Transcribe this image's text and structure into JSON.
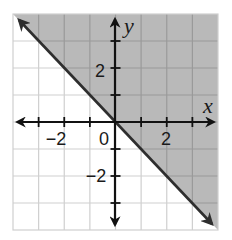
{
  "chart_data": {
    "type": "line",
    "title": "",
    "subtitle": "",
    "xlabel": "x",
    "ylabel": "y",
    "xlim": [
      -4,
      4
    ],
    "ylim": [
      -4,
      4
    ],
    "grid": true,
    "grid_step": 1,
    "legend": null,
    "x_tick_labels": [
      {
        "value": -2,
        "label": "−2"
      },
      {
        "value": 0,
        "label": "0"
      },
      {
        "value": 2,
        "label": "2"
      }
    ],
    "y_tick_labels": [
      {
        "value": 2,
        "label": "2"
      },
      {
        "value": -2,
        "label": "−2"
      }
    ],
    "x_ticks": [
      -3,
      -2,
      -1,
      0,
      1,
      2,
      3
    ],
    "y_ticks": [
      -3,
      -2,
      -1,
      1,
      2,
      3
    ],
    "series": [
      {
        "name": "boundary line y = -x",
        "style": "solid",
        "arrows": "both",
        "points": [
          [
            -4,
            4
          ],
          [
            4,
            -4
          ]
        ]
      }
    ],
    "shaded_region": {
      "description": "half-plane above the line y = -x (y >= -x)",
      "polygon": [
        [
          -4,
          4
        ],
        [
          4,
          4
        ],
        [
          4,
          -4
        ]
      ],
      "color": "#b9b9b9"
    },
    "annotations": []
  },
  "labels": {
    "x_axis": "x",
    "y_axis": "y",
    "origin": "0",
    "x_neg2": "−2",
    "x_pos2": "2",
    "y_pos2": "2",
    "y_neg2": "−2"
  },
  "colors": {
    "shade": "#b9b9b9",
    "grid_light": "#cfcfcf",
    "grid_dark": "#9a9a9a",
    "axis": "#111111",
    "boundary": "#2e2e2e"
  }
}
